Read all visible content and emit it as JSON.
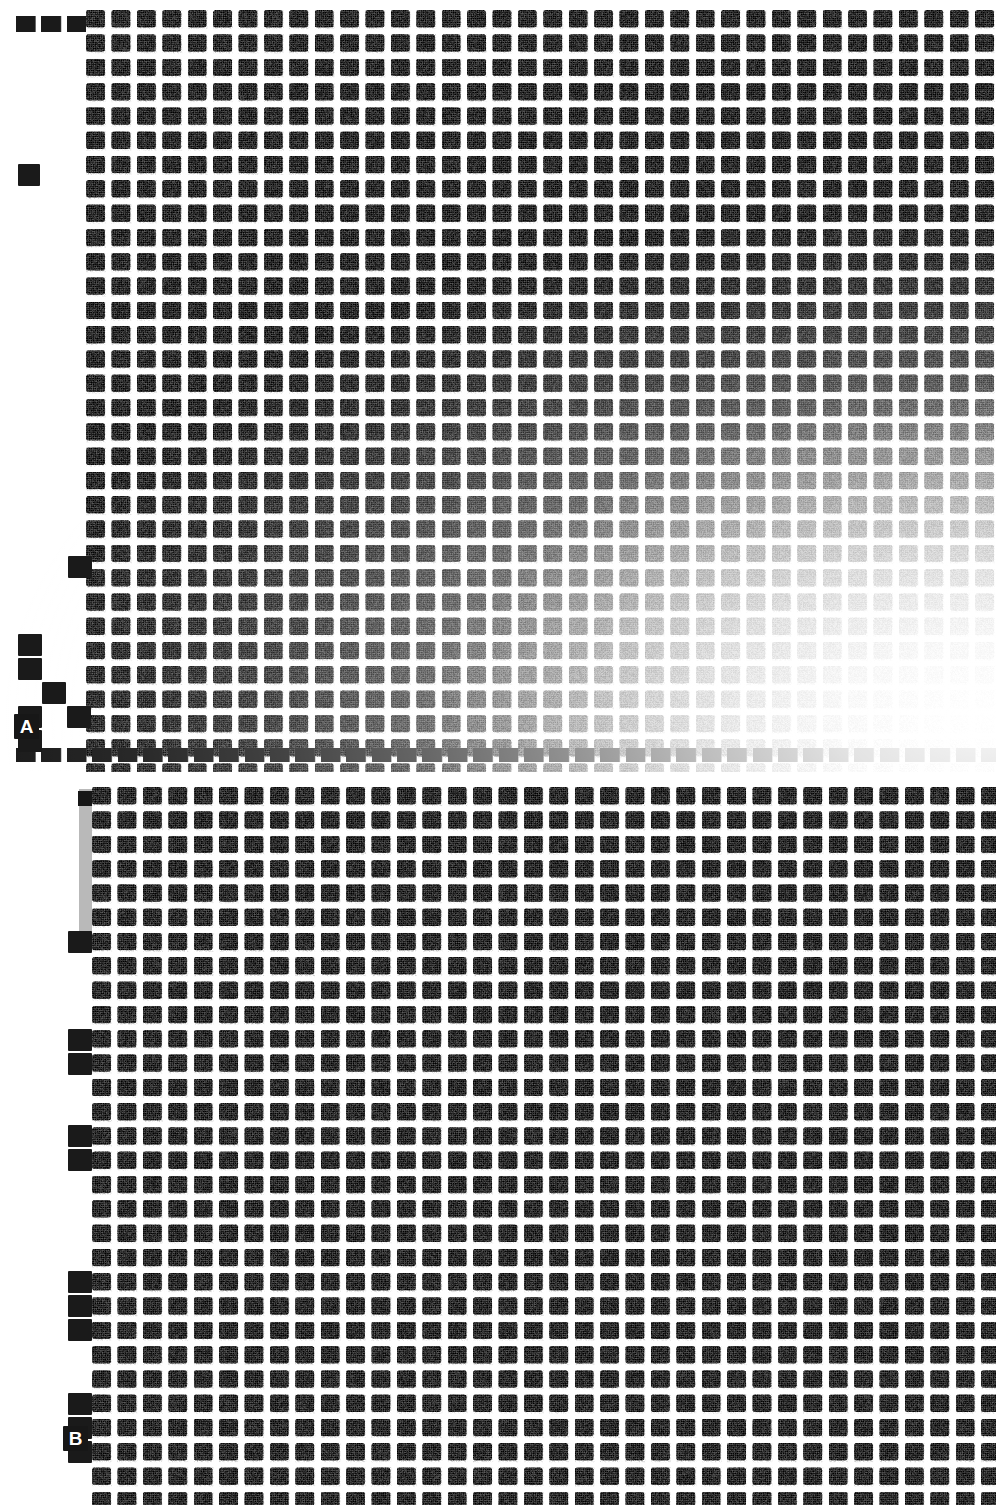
{
  "figure": {
    "kind": "dot-blot-autoradiograph",
    "background_color": "#ffffff",
    "dot_color": "#1a1a1a",
    "gray_smear_color": "#b9b9b9",
    "width_px": 996,
    "height_px": 1505,
    "panel_count": 2
  },
  "panels": [
    {
      "id": "A",
      "label": "A",
      "label_color": "#ffffff",
      "label_background": "#171717",
      "top_px": 0,
      "height_px": 772,
      "grid": {
        "columns": 36,
        "rows": 31,
        "cell_pitch_x_px": 25.4,
        "cell_pitch_y_px": 24.3,
        "dot_size_px": 19,
        "origin_x_px": 86,
        "origin_y_px": 10
      },
      "exposure": {
        "note": "signal fades toward lower-right corner",
        "fade_origin": "bottom-right",
        "fade_strength_pct": 97
      },
      "left_margin_markers": [
        {
          "x_px": 18,
          "y_px": 164,
          "w_px": 22,
          "h_px": 22
        },
        {
          "x_px": 68,
          "y_px": 556,
          "w_px": 24,
          "h_px": 22
        },
        {
          "x_px": 18,
          "y_px": 634,
          "w_px": 24,
          "h_px": 22
        },
        {
          "x_px": 18,
          "y_px": 658,
          "w_px": 24,
          "h_px": 22
        },
        {
          "x_px": 42,
          "y_px": 682,
          "w_px": 24,
          "h_px": 22
        },
        {
          "x_px": 67,
          "y_px": 706,
          "w_px": 24,
          "h_px": 22
        },
        {
          "x_px": 18,
          "y_px": 706,
          "w_px": 24,
          "h_px": 22
        },
        {
          "x_px": 18,
          "y_px": 730,
          "w_px": 24,
          "h_px": 22
        }
      ],
      "top_partial_row": {
        "x_px": 16,
        "y_px": 16,
        "w_px": 980,
        "h_px": 16
      },
      "bottom_partial_row": {
        "x_px": 16,
        "y_px": 748,
        "w_px": 980,
        "h_px": 14
      }
    },
    {
      "id": "B",
      "label": "B",
      "label_color": "#ffffff",
      "label_background": "#171717",
      "top_px": 775,
      "height_px": 730,
      "grid": {
        "columns": 35,
        "rows": 29,
        "cell_pitch_x_px": 25.4,
        "cell_pitch_y_px": 24.3,
        "dot_size_px": 19,
        "origin_x_px": 92,
        "origin_y_px": 12
      },
      "exposure": {
        "note": "uniform signal across the whole array",
        "fade_origin": "none",
        "fade_strength_pct": 0
      },
      "gray_smear": {
        "x_px": 79,
        "y_px": 14,
        "w_px": 22,
        "h_px": 150,
        "color": "#b9b9b9"
      },
      "left_margin_markers": [
        {
          "x_px": 68,
          "y_px": 156,
          "w_px": 24,
          "h_px": 22
        },
        {
          "x_px": 68,
          "y_px": 254,
          "w_px": 24,
          "h_px": 22
        },
        {
          "x_px": 68,
          "y_px": 278,
          "w_px": 24,
          "h_px": 22
        },
        {
          "x_px": 68,
          "y_px": 350,
          "w_px": 24,
          "h_px": 22
        },
        {
          "x_px": 68,
          "y_px": 374,
          "w_px": 24,
          "h_px": 22
        },
        {
          "x_px": 68,
          "y_px": 496,
          "w_px": 24,
          "h_px": 22
        },
        {
          "x_px": 68,
          "y_px": 520,
          "w_px": 24,
          "h_px": 22
        },
        {
          "x_px": 68,
          "y_px": 544,
          "w_px": 24,
          "h_px": 22
        },
        {
          "x_px": 68,
          "y_px": 618,
          "w_px": 24,
          "h_px": 22
        },
        {
          "x_px": 68,
          "y_px": 642,
          "w_px": 24,
          "h_px": 22
        },
        {
          "x_px": 68,
          "y_px": 666,
          "w_px": 24,
          "h_px": 22
        }
      ],
      "top_partial_row": {
        "x_px": 78,
        "y_px": 16,
        "w_px": 918,
        "h_px": 15
      }
    }
  ],
  "chart_data": {
    "type": "heatmap",
    "title": "",
    "subtitle": "",
    "xlabel": "",
    "ylabel": "",
    "grid": false,
    "legend_position": "none",
    "annotations": [
      "A",
      "B"
    ],
    "panels": [
      {
        "name": "A",
        "columns": 36,
        "rows": 31,
        "value_range": [
          0,
          1
        ],
        "description": "Dense rectangular array of hybridization dots; intensity uniform and near-maximal across the upper-left three quarters, then falling off smoothly toward the lower-right corner where dots become faint.",
        "intensity_by_quadrant": {
          "top_left": 0.95,
          "top_right": 0.93,
          "bottom_left": 0.92,
          "bottom_right": 0.18
        },
        "row_profile_right_edge": [
          0.95,
          0.95,
          0.94,
          0.94,
          0.93,
          0.92,
          0.9,
          0.88,
          0.86,
          0.84,
          0.82,
          0.8,
          0.78,
          0.75,
          0.72,
          0.68,
          0.63,
          0.58,
          0.52,
          0.46,
          0.4,
          0.35,
          0.3,
          0.26,
          0.22,
          0.19,
          0.16,
          0.14,
          0.12,
          0.11,
          0.1
        ],
        "column_profile_bottom_row": [
          0.93,
          0.93,
          0.92,
          0.92,
          0.91,
          0.91,
          0.9,
          0.9,
          0.89,
          0.88,
          0.87,
          0.86,
          0.85,
          0.83,
          0.81,
          0.79,
          0.76,
          0.73,
          0.69,
          0.65,
          0.6,
          0.55,
          0.5,
          0.45,
          0.4,
          0.35,
          0.31,
          0.27,
          0.24,
          0.21,
          0.18,
          0.16,
          0.14,
          0.13,
          0.12,
          0.11
        ]
      },
      {
        "name": "B",
        "columns": 35,
        "rows": 29,
        "value_range": [
          0,
          1
        ],
        "description": "Dense rectangular array of hybridization dots with uniformly strong signal across the entire grid; a light gray smear occupies the upper-left margin.",
        "intensity_by_quadrant": {
          "top_left": 0.94,
          "top_right": 0.94,
          "bottom_left": 0.94,
          "bottom_right": 0.93
        },
        "row_profile_right_edge": [
          0.94,
          0.94,
          0.94,
          0.94,
          0.94,
          0.94,
          0.94,
          0.94,
          0.94,
          0.94,
          0.94,
          0.94,
          0.94,
          0.94,
          0.94,
          0.94,
          0.94,
          0.94,
          0.94,
          0.94,
          0.94,
          0.94,
          0.94,
          0.94,
          0.94,
          0.94,
          0.94,
          0.94,
          0.94
        ],
        "column_profile_bottom_row": [
          0.94,
          0.94,
          0.94,
          0.94,
          0.94,
          0.94,
          0.94,
          0.94,
          0.94,
          0.94,
          0.94,
          0.94,
          0.94,
          0.94,
          0.94,
          0.94,
          0.94,
          0.94,
          0.94,
          0.94,
          0.94,
          0.94,
          0.94,
          0.94,
          0.94,
          0.94,
          0.94,
          0.94,
          0.94,
          0.94,
          0.94,
          0.94,
          0.94,
          0.94,
          0.94
        ]
      }
    ]
  }
}
